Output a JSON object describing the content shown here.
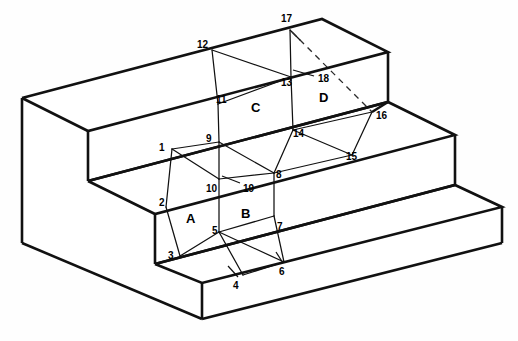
{
  "figure": {
    "background_color": "#fefefe",
    "line_color": "#111111",
    "width": 518,
    "height": 341
  },
  "face_labels": [
    {
      "id": "A",
      "text": "A",
      "x": 186,
      "y": 212
    },
    {
      "id": "B",
      "text": "B",
      "x": 241,
      "y": 207
    },
    {
      "id": "C",
      "text": "C",
      "x": 251,
      "y": 101
    },
    {
      "id": "D",
      "text": "D",
      "x": 319,
      "y": 91
    }
  ],
  "vertex_labels": [
    {
      "id": "1",
      "text": "1",
      "x": 159,
      "y": 143
    },
    {
      "id": "2",
      "text": "2",
      "x": 159,
      "y": 198
    },
    {
      "id": "3",
      "text": "3",
      "x": 168,
      "y": 251
    },
    {
      "id": "4",
      "text": "4",
      "x": 233,
      "y": 281
    },
    {
      "id": "5",
      "text": "5",
      "x": 212,
      "y": 226
    },
    {
      "id": "6",
      "text": "6",
      "x": 279,
      "y": 267
    },
    {
      "id": "7",
      "text": "7",
      "x": 277,
      "y": 222
    },
    {
      "id": "8",
      "text": "8",
      "x": 276,
      "y": 170
    },
    {
      "id": "9",
      "text": "9",
      "x": 206,
      "y": 134
    },
    {
      "id": "10",
      "text": "10",
      "x": 206,
      "y": 184
    },
    {
      "id": "11",
      "text": "11",
      "x": 216,
      "y": 95
    },
    {
      "id": "12",
      "text": "12",
      "x": 197,
      "y": 40
    },
    {
      "id": "13",
      "text": "13",
      "x": 281,
      "y": 78
    },
    {
      "id": "14",
      "text": "14",
      "x": 293,
      "y": 129
    },
    {
      "id": "15",
      "text": "15",
      "x": 346,
      "y": 152
    },
    {
      "id": "16",
      "text": "16",
      "x": 376,
      "y": 111
    },
    {
      "id": "17",
      "text": "17",
      "x": 281,
      "y": 14
    },
    {
      "id": "18",
      "text": "18",
      "x": 318,
      "y": 74
    },
    {
      "id": "19",
      "text": "19",
      "x": 243,
      "y": 184
    }
  ],
  "geometry": {
    "description": "Three-tier staircase solid drawn in parallel oblique projection with subdivided front faces",
    "vertex_count": 19,
    "region_count": 4
  }
}
